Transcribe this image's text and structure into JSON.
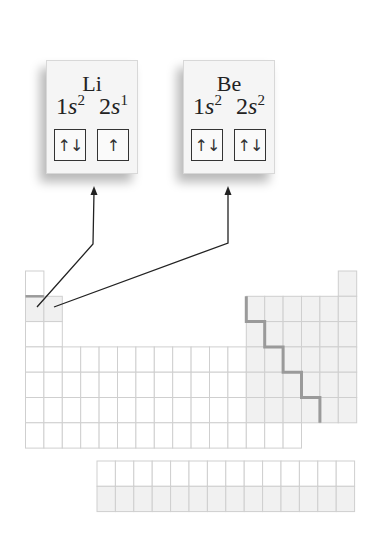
{
  "figure": {
    "cards": [
      {
        "element": "Li",
        "orbitals": [
          {
            "label": "1s",
            "superscript": "2",
            "arrows": "↑↓"
          },
          {
            "label": "2s",
            "superscript": "1",
            "arrows": "↑"
          }
        ]
      },
      {
        "element": "Be",
        "orbitals": [
          {
            "label": "1s",
            "superscript": "2",
            "arrows": "↑↓"
          },
          {
            "label": "2s",
            "superscript": "2",
            "arrows": "↑↓"
          }
        ]
      }
    ],
    "periodic_table": {
      "columns": 18,
      "main_rows": 7,
      "f_block_rows": 2,
      "f_block_columns": 14,
      "highlighted_cells": [
        "Li (period 2, group 1)",
        "Be (period 2, group 2)"
      ],
      "shaded_region": "p-block (groups 13-18)",
      "staircase": "metal / nonmetal dividing line"
    },
    "colors": {
      "grid_line": "#cfcfcf",
      "p_block_fill": "#f1f1f1",
      "staircase": "#9a9a9a",
      "arrow": "#222222",
      "card_fill": "#f5f5f5"
    }
  }
}
